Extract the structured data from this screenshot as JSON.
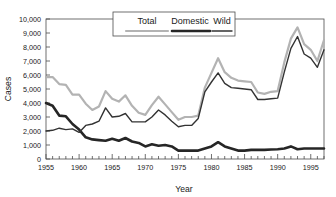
{
  "chart_data": {
    "type": "line",
    "title": "",
    "xlabel": "Year",
    "ylabel": "Cases",
    "xlim": [
      1955,
      1997
    ],
    "ylim": [
      0,
      10000
    ],
    "grid": false,
    "legend_position": "top-center",
    "x_ticks": [
      1955,
      1960,
      1965,
      1970,
      1975,
      1980,
      1985,
      1990,
      1995
    ],
    "x_tick_labels": [
      "1955",
      "1960",
      "1965",
      "1970",
      "1975",
      "1980",
      "1985",
      "1990",
      "1995"
    ],
    "x_minor_tick_step": 1,
    "y_ticks": [
      0,
      1000,
      2000,
      3000,
      4000,
      5000,
      6000,
      7000,
      8000,
      9000,
      10000
    ],
    "y_tick_labels": [
      "0",
      "1,000",
      "2,000",
      "3,000",
      "4,000",
      "5,000",
      "6,000",
      "7,000",
      "8,000",
      "9,000",
      "10,000"
    ],
    "x": [
      1955,
      1956,
      1957,
      1958,
      1959,
      1960,
      1961,
      1962,
      1963,
      1964,
      1965,
      1966,
      1967,
      1968,
      1969,
      1970,
      1971,
      1972,
      1973,
      1974,
      1975,
      1976,
      1977,
      1978,
      1979,
      1980,
      1981,
      1982,
      1983,
      1984,
      1985,
      1986,
      1987,
      1988,
      1989,
      1990,
      1991,
      1992,
      1993,
      1994,
      1995,
      1996,
      1997
    ],
    "series": [
      {
        "name": "Total",
        "color": "#b3b3b3",
        "width": 2.2,
        "values": [
          5850,
          5850,
          5350,
          5300,
          4600,
          4600,
          3950,
          3500,
          3750,
          4850,
          4300,
          4100,
          4550,
          3800,
          3300,
          3150,
          3850,
          4450,
          3900,
          3350,
          2800,
          3000,
          3000,
          3100,
          5100,
          6150,
          7200,
          6200,
          5800,
          5600,
          5550,
          5500,
          4750,
          4650,
          4800,
          4850,
          6900,
          8600,
          9400,
          8200,
          7800,
          7000,
          8500
        ]
      },
      {
        "name": "Domestic",
        "color": "#262626",
        "width": 2.6,
        "values": [
          4000,
          3800,
          3100,
          3050,
          2500,
          2100,
          1550,
          1400,
          1350,
          1300,
          1450,
          1300,
          1500,
          1250,
          1150,
          900,
          1050,
          950,
          1000,
          900,
          600,
          600,
          600,
          600,
          750,
          900,
          1200,
          900,
          750,
          600,
          600,
          650,
          650,
          650,
          680,
          700,
          750,
          900,
          700,
          750,
          750,
          750,
          750
        ]
      },
      {
        "name": "Wild",
        "color": "#333333",
        "width": 1.4,
        "values": [
          2000,
          2050,
          2200,
          2100,
          2150,
          1900,
          2400,
          2500,
          2700,
          3650,
          3000,
          3050,
          3250,
          2650,
          2650,
          2650,
          3000,
          3500,
          3150,
          2700,
          2300,
          2400,
          2400,
          2900,
          4800,
          5500,
          6150,
          5400,
          5100,
          5050,
          5000,
          4950,
          4250,
          4250,
          4300,
          4350,
          6200,
          7900,
          8750,
          7500,
          7200,
          6550,
          7800
        ]
      }
    ]
  },
  "legend": {
    "entries": [
      {
        "label": "Total"
      },
      {
        "label": "Domestic"
      },
      {
        "label": "Wild"
      }
    ]
  },
  "axes": {
    "y_title": "Cases",
    "x_title": "Year"
  }
}
